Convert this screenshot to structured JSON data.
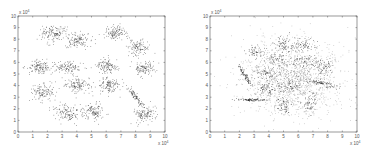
{
  "chart_data": [
    {
      "type": "scatter",
      "title": "",
      "xlabel": "",
      "ylabel": "",
      "x_multiplier_label": "x 10^4",
      "y_multiplier_label": "x 10^4",
      "xlim": [
        0,
        10
      ],
      "ylim": [
        0,
        10
      ],
      "xticks": [
        "0",
        "1",
        "2",
        "3",
        "4",
        "5",
        "6",
        "7",
        "8",
        "9",
        "10"
      ],
      "yticks": [
        "0",
        "1",
        "2",
        "3",
        "4",
        "5",
        "6",
        "7",
        "8",
        "9",
        "10"
      ],
      "grid": false,
      "legend": null,
      "description": "15 well-separated Gaussian clusters (S-set style), values in units of 10^4",
      "clusters": [
        {
          "cx": 2.4,
          "cy": 8.5,
          "sx": 0.45,
          "sy": 0.35,
          "n": 140
        },
        {
          "cx": 4.0,
          "cy": 7.9,
          "sx": 0.4,
          "sy": 0.35,
          "n": 120
        },
        {
          "cx": 6.7,
          "cy": 8.6,
          "sx": 0.4,
          "sy": 0.3,
          "n": 120
        },
        {
          "cx": 8.2,
          "cy": 7.3,
          "sx": 0.35,
          "sy": 0.35,
          "n": 110
        },
        {
          "cx": 1.4,
          "cy": 5.6,
          "sx": 0.45,
          "sy": 0.3,
          "n": 130
        },
        {
          "cx": 3.4,
          "cy": 5.6,
          "sx": 0.5,
          "sy": 0.25,
          "n": 110
        },
        {
          "cx": 6.1,
          "cy": 5.7,
          "sx": 0.4,
          "sy": 0.3,
          "n": 120
        },
        {
          "cx": 8.6,
          "cy": 5.5,
          "sx": 0.35,
          "sy": 0.35,
          "n": 110
        },
        {
          "cx": 4.0,
          "cy": 4.1,
          "sx": 0.45,
          "sy": 0.35,
          "n": 130
        },
        {
          "cx": 6.2,
          "cy": 4.0,
          "sx": 0.4,
          "sy": 0.35,
          "n": 120
        },
        {
          "cx": 1.7,
          "cy": 3.5,
          "sx": 0.4,
          "sy": 0.35,
          "n": 120
        },
        {
          "cx": 8.0,
          "cy": 3.0,
          "sx": 0.1,
          "sy": 0.55,
          "n": 90,
          "rot": 0.55
        },
        {
          "cx": 3.3,
          "cy": 1.7,
          "sx": 0.5,
          "sy": 0.35,
          "n": 130
        },
        {
          "cx": 5.1,
          "cy": 1.8,
          "sx": 0.4,
          "sy": 0.35,
          "n": 120
        },
        {
          "cx": 8.6,
          "cy": 1.6,
          "sx": 0.4,
          "sy": 0.35,
          "n": 120
        }
      ]
    },
    {
      "type": "scatter",
      "title": "",
      "xlabel": "",
      "ylabel": "",
      "x_multiplier_label": "x 10^4",
      "y_multiplier_label": "x 10^4",
      "xlim": [
        0,
        10
      ],
      "ylim": [
        0,
        10
      ],
      "xticks": [
        "0",
        "1",
        "2",
        "3",
        "4",
        "5",
        "6",
        "7",
        "8",
        "9",
        "10"
      ],
      "yticks": [
        "0",
        "1",
        "2",
        "3",
        "4",
        "5",
        "6",
        "7",
        "8",
        "9",
        "10"
      ],
      "grid": false,
      "legend": null,
      "description": "Highly overlapping clusters on a diffuse background (S4-set style), values in units of 10^4",
      "background": {
        "cx": 5.6,
        "cy": 4.8,
        "sx": 1.7,
        "sy": 1.6,
        "n": 1400
      },
      "clusters": [
        {
          "cx": 3.0,
          "cy": 6.9,
          "sx": 0.35,
          "sy": 0.3,
          "n": 50
        },
        {
          "cx": 5.0,
          "cy": 7.6,
          "sx": 0.35,
          "sy": 0.3,
          "n": 60
        },
        {
          "cx": 6.4,
          "cy": 7.4,
          "sx": 0.35,
          "sy": 0.3,
          "n": 60
        },
        {
          "cx": 4.6,
          "cy": 6.4,
          "sx": 0.35,
          "sy": 0.3,
          "n": 50
        },
        {
          "cx": 6.3,
          "cy": 6.1,
          "sx": 0.4,
          "sy": 0.3,
          "n": 60
        },
        {
          "cx": 7.7,
          "cy": 5.7,
          "sx": 0.35,
          "sy": 0.35,
          "n": 60
        },
        {
          "cx": 3.8,
          "cy": 5.1,
          "sx": 0.4,
          "sy": 0.35,
          "n": 60
        },
        {
          "cx": 2.4,
          "cy": 4.8,
          "sx": 0.08,
          "sy": 0.45,
          "n": 80,
          "rot": 0.45
        },
        {
          "cx": 7.3,
          "cy": 4.3,
          "sx": 0.7,
          "sy": 0.1,
          "n": 90,
          "rot": -0.25
        },
        {
          "cx": 5.4,
          "cy": 3.9,
          "sx": 0.4,
          "sy": 0.3,
          "n": 60
        },
        {
          "cx": 3.8,
          "cy": 3.7,
          "sx": 0.35,
          "sy": 0.25,
          "n": 60
        },
        {
          "cx": 2.9,
          "cy": 2.8,
          "sx": 0.6,
          "sy": 0.05,
          "n": 90
        },
        {
          "cx": 6.8,
          "cy": 2.6,
          "sx": 0.3,
          "sy": 0.45,
          "n": 60
        },
        {
          "cx": 5.0,
          "cy": 2.2,
          "sx": 0.3,
          "sy": 0.35,
          "n": 60
        }
      ]
    }
  ],
  "style": {
    "point_color": "#222222",
    "axis_color": "#555555"
  }
}
